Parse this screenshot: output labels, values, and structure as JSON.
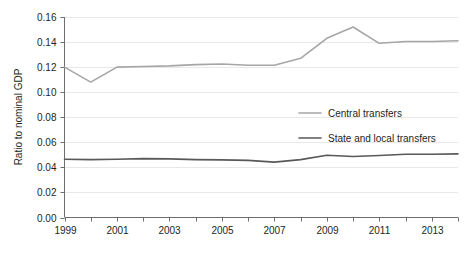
{
  "chart_data": {
    "type": "line",
    "title": "",
    "subtitle": "",
    "xlabel": "",
    "ylabel": "Ratio to nominal GDP",
    "xlim": [
      1999,
      2014
    ],
    "ylim": [
      0.0,
      0.16
    ],
    "grid": true,
    "grid_axis": "y",
    "legend_position": "center-right",
    "x": [
      1999,
      2000,
      2001,
      2002,
      2003,
      2004,
      2005,
      2006,
      2007,
      2008,
      2009,
      2010,
      2011,
      2012,
      2013,
      2014
    ],
    "xticks": [
      1999,
      2000,
      2001,
      2002,
      2003,
      2004,
      2005,
      2006,
      2007,
      2008,
      2009,
      2010,
      2011,
      2012,
      2013,
      2014
    ],
    "xtick_labels": [
      "1999",
      "",
      "2001",
      "",
      "2003",
      "",
      "2005",
      "",
      "2007",
      "",
      "2009",
      "",
      "2011",
      "",
      "2013",
      ""
    ],
    "xtick_labels_shown": [
      "1999",
      "2001",
      "2003",
      "2005",
      "2007",
      "2009",
      "2011",
      "2013"
    ],
    "yticks": [
      0.0,
      0.02,
      0.04,
      0.06,
      0.08,
      0.1,
      0.12,
      0.14,
      0.16
    ],
    "ytick_labels": [
      "0.00",
      "0.02",
      "0.04",
      "0.06",
      "0.08",
      "0.10",
      "0.12",
      "0.14",
      "0.16"
    ],
    "series": [
      {
        "name": "Central transfers",
        "color": "#a6a6a6",
        "values": [
          0.12,
          0.108,
          0.12,
          0.1205,
          0.121,
          0.122,
          0.1225,
          0.1215,
          0.1215,
          0.127,
          0.143,
          0.152,
          0.139,
          0.1405,
          0.1405,
          0.141
        ]
      },
      {
        "name": "State and local transfers",
        "color": "#58595b",
        "values": [
          0.0465,
          0.0462,
          0.0465,
          0.047,
          0.0468,
          0.0462,
          0.046,
          0.0456,
          0.0442,
          0.0462,
          0.0497,
          0.0487,
          0.0495,
          0.0505,
          0.0505,
          0.0508
        ]
      }
    ]
  },
  "legend": {
    "entries": [
      {
        "label": "Central transfers",
        "color": "#a6a6a6"
      },
      {
        "label": "State and local transfers",
        "color": "#58595b"
      }
    ]
  },
  "axes": {
    "y_title": "Ratio to nominal GDP"
  }
}
